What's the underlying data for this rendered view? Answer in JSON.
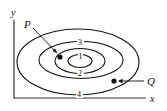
{
  "diagram": {
    "type": "contour-plot",
    "axes": {
      "x_label": "x",
      "y_label": "y"
    },
    "contours": [
      {
        "level": "1",
        "cx": 80,
        "cy": 61,
        "rx": 12,
        "ry": 6.5
      },
      {
        "level": "2",
        "cx": 80,
        "cy": 61,
        "rx": 25,
        "ry": 12.5
      },
      {
        "level": "3",
        "cx": 81,
        "cy": 60,
        "rx": 42,
        "ry": 18.5
      },
      {
        "level": "4",
        "cx": 78,
        "cy": 62,
        "rx": 61,
        "ry": 33
      }
    ],
    "points": [
      {
        "label": "P",
        "x": 60,
        "y": 57
      },
      {
        "label": "Q",
        "x": 114,
        "y": 81
      }
    ],
    "colors": {
      "ink": "#111111",
      "background": "#ffffff"
    }
  }
}
